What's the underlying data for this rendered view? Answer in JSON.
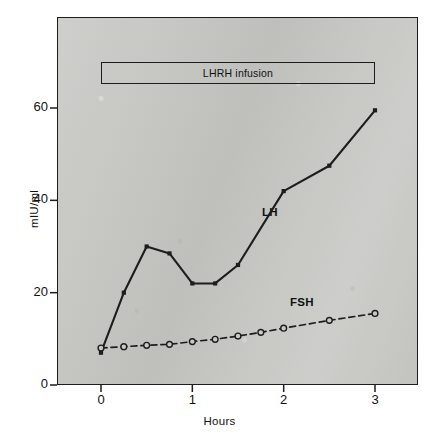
{
  "figure": {
    "annotation_box_label": "LHRH infusion",
    "series_labels": {
      "lh": "LH",
      "fsh": "FSH"
    }
  },
  "chart_data": {
    "type": "line",
    "title": "",
    "subtitle": "",
    "xlabel": "Hours",
    "ylabel": "mIU/ml",
    "xlim": [
      -0.18,
      3.48
    ],
    "ylim": [
      0,
      72
    ],
    "xticks": [
      0,
      1,
      2,
      3
    ],
    "xticklabels": [
      "0",
      "1",
      "2",
      "3"
    ],
    "yticks": [
      0,
      20,
      40,
      60
    ],
    "yticklabels": [
      "0",
      "20",
      "40",
      "60"
    ],
    "grid": false,
    "legend": "inline-labels",
    "background": "#c9c9c6",
    "foreground": "#1d1d1d",
    "annotations": [
      {
        "name": "lhrh-infusion-bar",
        "text": "LHRH infusion",
        "x_start": 0,
        "x_end": 3,
        "y_value": 68
      },
      {
        "name": "lh-inline-label",
        "text": "LH",
        "x": 1.85,
        "y": 37
      },
      {
        "name": "fsh-inline-label",
        "text": "FSH",
        "x": 2.2,
        "y": 17.5
      }
    ],
    "series": [
      {
        "name": "LH",
        "style": "solid",
        "marker": "filled-square",
        "color": "#1d1d1d",
        "x": [
          0,
          0.25,
          0.5,
          0.75,
          1.0,
          1.25,
          1.5,
          2.0,
          2.5,
          3.0
        ],
        "values": [
          7,
          20,
          30,
          28.5,
          22,
          22,
          26,
          42,
          47.5,
          59.5
        ]
      },
      {
        "name": "FSH",
        "style": "dashed",
        "marker": "open-circle",
        "color": "#1d1d1d",
        "x": [
          0,
          0.25,
          0.5,
          0.75,
          1.0,
          1.25,
          1.5,
          1.75,
          2.0,
          2.5,
          3.0
        ],
        "values": [
          8,
          8.3,
          8.6,
          8.8,
          9.4,
          9.9,
          10.6,
          11.4,
          12.3,
          14.0,
          15.5
        ]
      }
    ]
  }
}
